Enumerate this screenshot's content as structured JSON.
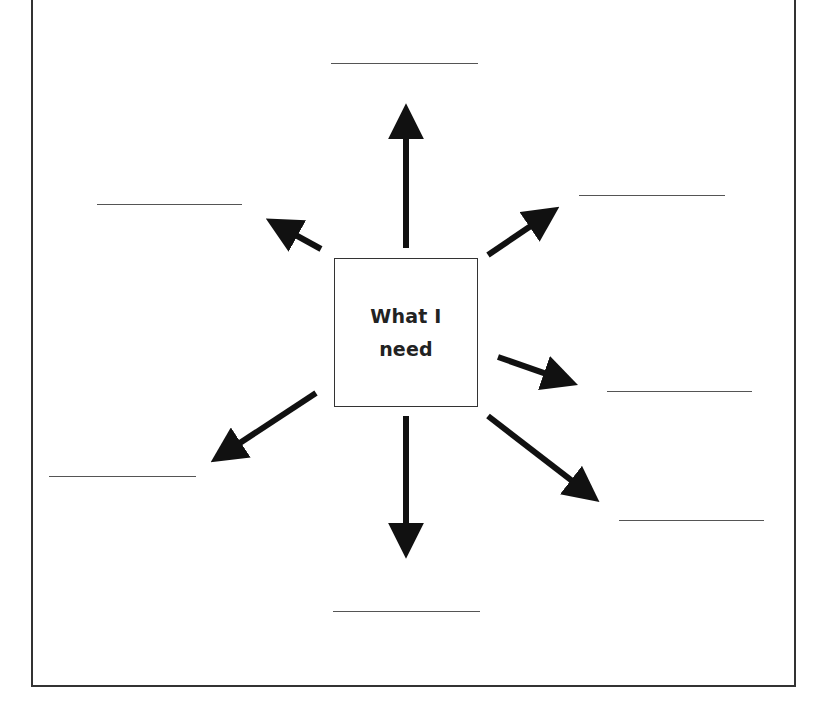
{
  "worksheet": {
    "center_box": {
      "line1": "What I",
      "line2": "need"
    },
    "colors": {
      "frame": "#333333",
      "arrow": "#111111",
      "blank_line": "#555555",
      "background": "#ffffff"
    },
    "arrows": [
      {
        "name": "arrow-up",
        "x1": 406,
        "y1": 248,
        "x2": 406,
        "y2": 100
      },
      {
        "name": "arrow-up-left",
        "x1": 321,
        "y1": 249,
        "x2": 263,
        "y2": 217
      },
      {
        "name": "arrow-up-right",
        "x1": 488,
        "y1": 255,
        "x2": 562,
        "y2": 205
      },
      {
        "name": "arrow-right",
        "x1": 498,
        "y1": 357,
        "x2": 581,
        "y2": 386
      },
      {
        "name": "arrow-down-right",
        "x1": 488,
        "y1": 416,
        "x2": 602,
        "y2": 504
      },
      {
        "name": "arrow-down",
        "x1": 406,
        "y1": 416,
        "x2": 406,
        "y2": 562
      },
      {
        "name": "arrow-down-left",
        "x1": 316,
        "y1": 393,
        "x2": 208,
        "y2": 464
      }
    ],
    "blank_lines": [
      {
        "name": "answer-line-top",
        "x": 331,
        "y": 63,
        "w": 147,
        "value": ""
      },
      {
        "name": "answer-line-upper-left",
        "x": 97,
        "y": 204,
        "w": 145,
        "value": ""
      },
      {
        "name": "answer-line-upper-right",
        "x": 579,
        "y": 195,
        "w": 146,
        "value": ""
      },
      {
        "name": "answer-line-right",
        "x": 607,
        "y": 391,
        "w": 145,
        "value": ""
      },
      {
        "name": "answer-line-lower-right",
        "x": 619,
        "y": 520,
        "w": 145,
        "value": ""
      },
      {
        "name": "answer-line-lower-left",
        "x": 49,
        "y": 476,
        "w": 147,
        "value": ""
      },
      {
        "name": "answer-line-bottom",
        "x": 333,
        "y": 611,
        "w": 147,
        "value": ""
      }
    ]
  }
}
